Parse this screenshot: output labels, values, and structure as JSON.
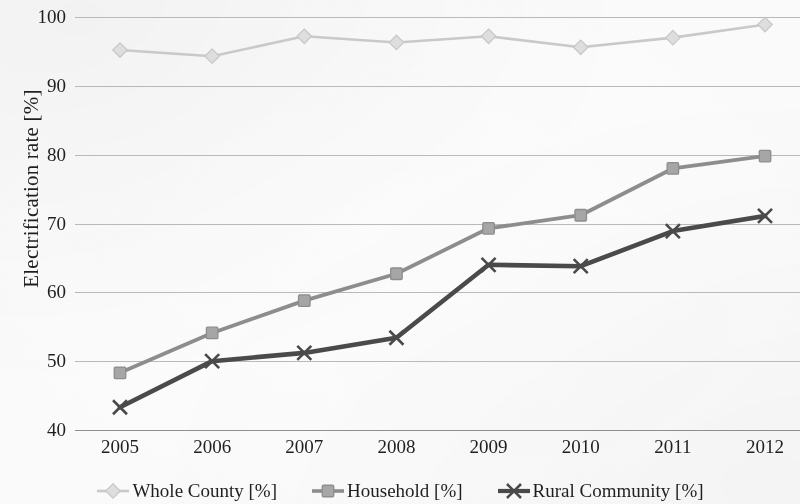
{
  "chart_data": {
    "type": "line",
    "title": "",
    "xlabel": "",
    "ylabel": "Electrification rate [%]",
    "categories": [
      "2005",
      "2006",
      "2007",
      "2008",
      "2009",
      "2010",
      "2011",
      "2012"
    ],
    "x": [
      2005,
      2006,
      2007,
      2008,
      2009,
      2010,
      2011,
      2012
    ],
    "ylim": [
      40,
      100
    ],
    "yticks": [
      40,
      50,
      60,
      70,
      80,
      90,
      100
    ],
    "ytick_labels": [
      "40",
      "50",
      "60",
      "70",
      "80",
      "90",
      "100"
    ],
    "grid": true,
    "legend_position": "bottom",
    "series": [
      {
        "name": "Whole County [%]",
        "marker": "diamond",
        "color": "#c9c9c9",
        "marker_color": "#dedede",
        "values": [
          95.2,
          94.3,
          97.2,
          96.3,
          97.2,
          95.6,
          97.0,
          98.9
        ]
      },
      {
        "name": "Household [%]",
        "marker": "square",
        "color": "#8d8d8d",
        "marker_color": "#a6a6a6",
        "values": [
          48.3,
          54.1,
          58.8,
          62.7,
          69.3,
          71.2,
          78.0,
          79.8
        ]
      },
      {
        "name": "Rural Community [%]",
        "marker": "cross",
        "color": "#4a4a4a",
        "marker_color": "#3b3b3b",
        "values": [
          43.3,
          50.0,
          51.2,
          53.4,
          64.0,
          63.8,
          68.9,
          71.1
        ]
      }
    ]
  },
  "axes": {
    "y_title": "Electrification rate [%]"
  },
  "legend": {
    "items": [
      {
        "label": "Whole County [%]",
        "icon": "diamond-marker-icon"
      },
      {
        "label": "Household [%]",
        "icon": "square-marker-icon"
      },
      {
        "label": "Rural Community [%]",
        "icon": "cross-marker-icon"
      }
    ]
  }
}
